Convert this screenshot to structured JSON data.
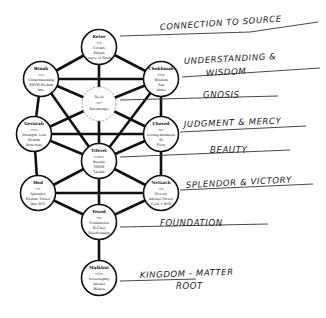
{
  "diagram": {
    "nodes": [
      {
        "id": "keter",
        "name": "Keter",
        "lines": [
          "כתר",
          "Crown",
          "Ehyeh",
          "Source of Desire"
        ]
      },
      {
        "id": "binah",
        "name": "Binah",
        "lines": [
          "בינה",
          "Understanding",
          "YHVH Elohim",
          "Imo"
        ]
      },
      {
        "id": "chokhmah",
        "name": "Chokhmah",
        "lines": [
          "חכמה",
          "Wisdom",
          "Yah",
          "Abba"
        ]
      },
      {
        "id": "daat",
        "name": "Da'at",
        "lines": [
          "דעת",
          "Knowledge"
        ]
      },
      {
        "id": "gevurah",
        "name": "Gevurah",
        "lines": [
          "גבורה",
          "Strength, Law",
          "Elohim",
          "Structure"
        ]
      },
      {
        "id": "chesed",
        "name": "Chesed",
        "lines": [
          "חסד",
          "Loving-kindness",
          "El",
          "Flow"
        ]
      },
      {
        "id": "tiferet",
        "name": "Tiferet",
        "lines": [
          "תפארת",
          "Beauty",
          "YHVH",
          "Tzadik"
        ]
      },
      {
        "id": "hod",
        "name": "Hod",
        "lines": [
          "הוד",
          "Splendor",
          "Elohim Tzvaot",
          "Imo W/G"
        ]
      },
      {
        "id": "netzach",
        "name": "Netzach",
        "lines": [
          "נצח",
          "Victory",
          "Adonai Tzvaot",
          "Gold + W/D"
        ]
      },
      {
        "id": "yesod",
        "name": "Yesod",
        "lines": [
          "יסוד",
          "Foundation",
          "El Chai",
          "Relationship"
        ]
      },
      {
        "id": "malkhut",
        "name": "Malkhut",
        "lines": [
          "מלכות",
          "Sovereignty",
          "Adonai",
          "Makes"
        ]
      }
    ],
    "annotations": [
      {
        "id": "ann-keter",
        "text": "Connection to Source"
      },
      {
        "id": "ann-binah-chokhmah-1",
        "text": "Understanding &"
      },
      {
        "id": "ann-binah-chokhmah-2",
        "text": "Wisdom"
      },
      {
        "id": "ann-daat",
        "text": "Gnosis"
      },
      {
        "id": "ann-gevurah-chesed",
        "text": "Judgment & Mercy"
      },
      {
        "id": "ann-tiferet",
        "text": "Beauty"
      },
      {
        "id": "ann-hod-netzach",
        "text": "Splendor & Victory"
      },
      {
        "id": "ann-yesod",
        "text": "Foundation"
      },
      {
        "id": "ann-malkhut-1",
        "text": "Kingdom - Matter"
      },
      {
        "id": "ann-malkhut-2",
        "text": "Root"
      }
    ]
  }
}
